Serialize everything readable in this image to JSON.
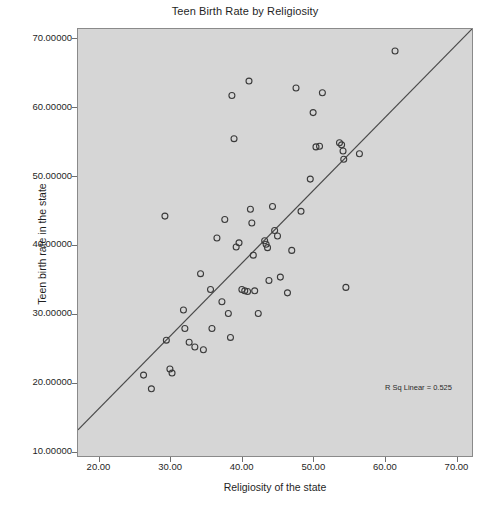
{
  "chart_data": {
    "type": "scatter",
    "title": "Teen Birth Rate by Religiosity",
    "xlabel": "Religiosity of the state",
    "ylabel": "Teen birth rate in the state",
    "xlim": [
      17.0,
      72.3
    ],
    "ylim": [
      9.2,
      71.5
    ],
    "grid": false,
    "legend": null,
    "annotations": [
      {
        "name": "r-squared",
        "text": "R Sq Linear = 0.525",
        "x": 57.0,
        "y": 21.5
      }
    ],
    "xticks": [
      20.0,
      30.0,
      40.0,
      50.0,
      60.0,
      70.0
    ],
    "xticklabels": [
      "20.00",
      "30.00",
      "40.00",
      "50.00",
      "60.00",
      "70.00"
    ],
    "yticks": [
      10.0,
      20.0,
      30.0,
      40.0,
      50.0,
      60.0,
      70.0
    ],
    "yticklabels": [
      "10.00000",
      "20.00000",
      "30.00000",
      "40.00000",
      "50.00000",
      "60.00000",
      "70.00000"
    ],
    "fit_line": {
      "name": "linear-fit",
      "r_squared": 0.525,
      "x0": 17.0,
      "y0": 13.0,
      "x1": 72.3,
      "y1": 71.5
    },
    "marker": {
      "shape": "open-circle",
      "radius": 3.0,
      "stroke": "#3a3a3a",
      "fill": "none"
    },
    "points": [
      {
        "x": 26.2,
        "y": 21.0
      },
      {
        "x": 27.3,
        "y": 19.0
      },
      {
        "x": 29.2,
        "y": 44.2
      },
      {
        "x": 29.4,
        "y": 26.1
      },
      {
        "x": 29.9,
        "y": 21.9
      },
      {
        "x": 30.2,
        "y": 21.3
      },
      {
        "x": 31.8,
        "y": 30.5
      },
      {
        "x": 32.0,
        "y": 27.8
      },
      {
        "x": 32.6,
        "y": 25.8
      },
      {
        "x": 33.4,
        "y": 25.1
      },
      {
        "x": 34.2,
        "y": 35.8
      },
      {
        "x": 34.6,
        "y": 24.7
      },
      {
        "x": 35.6,
        "y": 33.5
      },
      {
        "x": 35.8,
        "y": 27.8
      },
      {
        "x": 36.5,
        "y": 41.0
      },
      {
        "x": 37.2,
        "y": 31.7
      },
      {
        "x": 37.6,
        "y": 43.7
      },
      {
        "x": 38.1,
        "y": 30.0
      },
      {
        "x": 38.4,
        "y": 26.5
      },
      {
        "x": 38.6,
        "y": 61.8
      },
      {
        "x": 38.9,
        "y": 55.5
      },
      {
        "x": 39.2,
        "y": 39.7
      },
      {
        "x": 39.6,
        "y": 40.3
      },
      {
        "x": 40.0,
        "y": 33.5
      },
      {
        "x": 40.4,
        "y": 33.3
      },
      {
        "x": 40.8,
        "y": 33.2
      },
      {
        "x": 41.0,
        "y": 63.9
      },
      {
        "x": 41.2,
        "y": 45.2
      },
      {
        "x": 41.4,
        "y": 43.2
      },
      {
        "x": 41.6,
        "y": 38.5
      },
      {
        "x": 41.8,
        "y": 33.3
      },
      {
        "x": 42.3,
        "y": 30.0
      },
      {
        "x": 43.2,
        "y": 40.6
      },
      {
        "x": 43.4,
        "y": 40.1
      },
      {
        "x": 43.6,
        "y": 39.6
      },
      {
        "x": 43.8,
        "y": 34.8
      },
      {
        "x": 44.3,
        "y": 45.6
      },
      {
        "x": 44.6,
        "y": 42.1
      },
      {
        "x": 45.0,
        "y": 41.3
      },
      {
        "x": 45.4,
        "y": 35.3
      },
      {
        "x": 46.4,
        "y": 33.0
      },
      {
        "x": 47.0,
        "y": 39.2
      },
      {
        "x": 47.6,
        "y": 62.9
      },
      {
        "x": 48.3,
        "y": 44.9
      },
      {
        "x": 49.6,
        "y": 49.6
      },
      {
        "x": 50.0,
        "y": 59.3
      },
      {
        "x": 50.4,
        "y": 54.3
      },
      {
        "x": 50.9,
        "y": 54.4
      },
      {
        "x": 51.3,
        "y": 62.2
      },
      {
        "x": 53.7,
        "y": 54.9
      },
      {
        "x": 54.0,
        "y": 54.6
      },
      {
        "x": 54.2,
        "y": 53.7
      },
      {
        "x": 54.3,
        "y": 52.5
      },
      {
        "x": 54.6,
        "y": 33.8
      },
      {
        "x": 56.5,
        "y": 53.3
      },
      {
        "x": 61.5,
        "y": 68.3
      }
    ]
  }
}
